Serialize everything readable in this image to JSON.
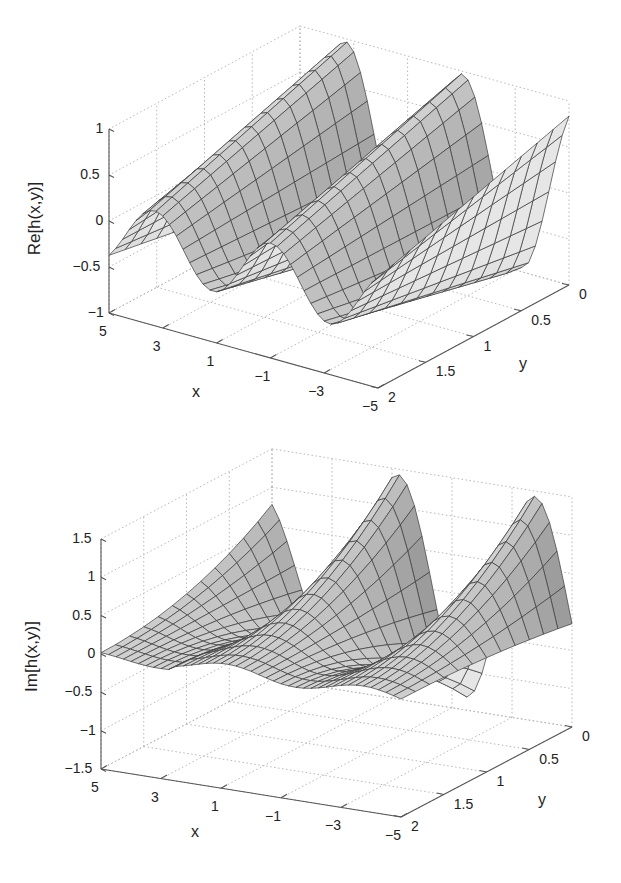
{
  "chart_data": [
    {
      "type": "surface",
      "id": "re",
      "title": "",
      "xlabel": "x",
      "ylabel": "y",
      "zlabel": "Re[h(x,y)]",
      "xlim": [
        -5,
        5
      ],
      "ylim": [
        0,
        2
      ],
      "zlim": [
        -1,
        1
      ],
      "xticks": [
        "5",
        "3",
        "1",
        "−1",
        "−3",
        "−5"
      ],
      "xtick_values": [
        5,
        3,
        1,
        -1,
        -3,
        -5
      ],
      "yticks": [
        "0",
        "0.5",
        "1",
        "1.5",
        "2"
      ],
      "ytick_values": [
        0,
        0.5,
        1,
        1.5,
        2
      ],
      "zticks": [
        "1",
        "0.5",
        "0",
        "−0.5",
        "−1"
      ],
      "ztick_values": [
        1,
        0.5,
        0,
        -0.5,
        -1
      ],
      "grid": true,
      "colormap": "gray",
      "description": "Oscillating surface along x with ridges near x=3.3, x=-0.5 and rising toward x=-5; amplitude grows toward y=0 (peak ~1 at back, ~0.3 at front)",
      "approx_ridges": [
        {
          "x": 3.3,
          "z_at_y0": 1.0,
          "z_at_y2": 0.3
        },
        {
          "x": -0.5,
          "z_at_y0": 0.95,
          "z_at_y2": 0.05
        },
        {
          "x": -5.0,
          "z_at_y0": 0.9,
          "z_at_y2": -0.3
        }
      ],
      "approx_troughs": [
        {
          "x": 1.4,
          "z": -0.45
        },
        {
          "x": -3.0,
          "z": -0.6
        }
      ]
    },
    {
      "type": "surface",
      "id": "im",
      "title": "",
      "xlabel": "x",
      "ylabel": "y",
      "zlabel": "Im[h(x,y)]",
      "xlim": [
        -5,
        5
      ],
      "ylim": [
        0,
        2
      ],
      "zlim": [
        -1.5,
        1.5
      ],
      "xticks": [
        "5",
        "3",
        "1",
        "−1",
        "−3",
        "−5"
      ],
      "xtick_values": [
        5,
        3,
        1,
        -1,
        -3,
        -5
      ],
      "yticks": [
        "0",
        "0.5",
        "1",
        "1.5",
        "2"
      ],
      "ytick_values": [
        0,
        0.5,
        1,
        1.5,
        2
      ],
      "zticks": [
        "1.5",
        "1",
        "0.5",
        "0",
        "−0.5",
        "−1",
        "−1.5"
      ],
      "ztick_values": [
        1.5,
        1,
        0.5,
        0,
        -0.5,
        -1,
        -1.5
      ],
      "grid": true,
      "colormap": "gray",
      "description": "Oscillating surface along x; near zero at front (y=2), ridges up to ~1.5 near x=0.8 and x=-3.8 at back (y=0)",
      "approx_ridges": [
        {
          "x": 3.6,
          "z_at_y0": 0.6,
          "z_at_y2": -0.1
        },
        {
          "x": 0.8,
          "z_at_y0": 1.45,
          "z_at_y2": 0.1
        },
        {
          "x": -3.8,
          "z_at_y0": 1.5,
          "z_at_y2": -0.2
        }
      ],
      "approx_troughs": [
        {
          "x": 2.0,
          "z": -0.3
        },
        {
          "x": -1.8,
          "z": -0.75
        }
      ]
    }
  ],
  "plots": {
    "top": {
      "zlabel": "Re[h(x,y)]",
      "xlabel": "x",
      "ylabel": "y",
      "zticks": [
        "1",
        "0.5",
        "0",
        "−0.5",
        "−1"
      ],
      "xticks": [
        "5",
        "3",
        "1",
        "−1",
        "−3",
        "−5"
      ],
      "yticks": [
        "0",
        "0.5",
        "1",
        "1.5",
        "2"
      ]
    },
    "bottom": {
      "zlabel": "Im[h(x,y)]",
      "xlabel": "x",
      "ylabel": "y",
      "zticks": [
        "1.5",
        "1",
        "0.5",
        "0",
        "−0.5",
        "−1",
        "−1.5"
      ],
      "xticks": [
        "5",
        "3",
        "1",
        "−1",
        "−3",
        "−5"
      ],
      "yticks": [
        "0",
        "0.5",
        "1",
        "1.5",
        "2"
      ]
    }
  },
  "colors": {
    "axis": "#555555",
    "grid": "#b8b8b8",
    "edge": "#3a3a3a",
    "text": "#222222"
  }
}
